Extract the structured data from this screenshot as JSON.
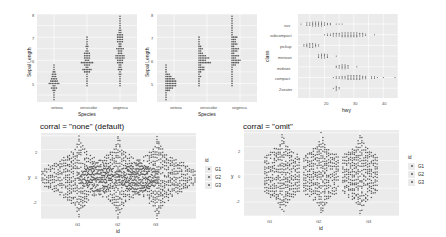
{
  "chart_data": [
    {
      "type": "scatter",
      "subtype": "dotplot",
      "title": "",
      "xlabel": "Species",
      "ylabel": "Sepal Length",
      "categories": [
        "setosa",
        "versicolor",
        "virginica"
      ],
      "yticks": [
        5,
        6,
        7,
        8
      ],
      "ylim": [
        4.2,
        8.0
      ],
      "stackdir": "center",
      "ranges": {
        "setosa": [
          4.3,
          5.8
        ],
        "versicolor": [
          4.9,
          7.0
        ],
        "virginica": [
          4.9,
          7.9
        ]
      },
      "grid": true
    },
    {
      "type": "scatter",
      "subtype": "dotplot",
      "title": "",
      "xlabel": "Species",
      "ylabel": "Sepal Length",
      "categories": [
        "setosa",
        "versicolor",
        "virginica"
      ],
      "yticks": [
        5,
        6,
        7,
        8
      ],
      "ylim": [
        4.2,
        8.0
      ],
      "stackdir": "up",
      "ranges": {
        "setosa": [
          4.3,
          5.8
        ],
        "versicolor": [
          4.9,
          7.0
        ],
        "virginica": [
          4.9,
          7.9
        ]
      },
      "grid": true
    },
    {
      "type": "scatter",
      "subtype": "dotplot",
      "title": "",
      "xlabel": "hwy",
      "ylabel": "class",
      "categories": [
        "2seater",
        "compact",
        "midsize",
        "minivan",
        "pickup",
        "subcompact",
        "suv"
      ],
      "xticks": [
        20,
        30,
        40
      ],
      "xlim": [
        11,
        45
      ],
      "ranges": {
        "suv": [
          12,
          27
        ],
        "subcompact": [
          20,
          44
        ],
        "pickup": [
          12,
          22
        ],
        "minivan": [
          17,
          24
        ],
        "midsize": [
          23,
          32
        ],
        "compact": [
          23,
          44
        ],
        "2seater": [
          23,
          26
        ]
      },
      "grid": true
    },
    {
      "type": "scatter",
      "subtype": "beeswarm",
      "title": "corral = \"none\" (default)",
      "xlabel": "id",
      "ylabel": "y",
      "categories": [
        "G1",
        "G2",
        "G3"
      ],
      "yticks": [
        -2,
        0,
        2
      ],
      "ylim": [
        -3,
        3.2
      ],
      "legend": {
        "title": "id",
        "entries": [
          "G1",
          "G2",
          "G3"
        ],
        "position": "right"
      },
      "grid": true
    },
    {
      "type": "scatter",
      "subtype": "beeswarm",
      "title": "corral = \"omit\"",
      "xlabel": "id",
      "ylabel": "y",
      "categories": [
        "G1",
        "G2",
        "G3"
      ],
      "yticks": [
        -2,
        0,
        2
      ],
      "ylim": [
        -3,
        3.2
      ],
      "legend": {
        "title": "id",
        "entries": [
          "G1",
          "G2",
          "G3"
        ],
        "position": "right"
      },
      "grid": true
    }
  ],
  "plots": {
    "p1": {
      "ylabel": "Sepal Length",
      "xlabel": "Species",
      "yt": [
        "8",
        "7",
        "6",
        "5"
      ],
      "xt": [
        "setosa",
        "versicolor",
        "virginica"
      ]
    },
    "p2": {
      "ylabel": "Sepal Length",
      "xlabel": "Species",
      "yt": [
        "8",
        "7",
        "6",
        "5"
      ],
      "xt": [
        "setosa",
        "versicolor",
        "virginica"
      ]
    },
    "p3": {
      "ylabel": "class",
      "xlabel": "hwy",
      "yt": [
        "suv",
        "subcompact",
        "pickup",
        "minivan",
        "midsize",
        "compact",
        "2seater"
      ],
      "xt": [
        "20",
        "30",
        "40"
      ]
    },
    "p4": {
      "title": "corral = \"none\" (default)",
      "ylabel": "y",
      "xlabel": "id",
      "yt": [
        "2",
        "0",
        "-2"
      ],
      "xt": [
        "G1",
        "G2",
        "G3"
      ],
      "legend_title": "id",
      "legend": [
        "G1",
        "G2",
        "G3"
      ]
    },
    "p5": {
      "title": "corral = \"omit\"",
      "ylabel": "y",
      "xlabel": "id",
      "yt": [
        "2",
        "0",
        "-2"
      ],
      "xt": [
        "G1",
        "G2",
        "G3"
      ],
      "legend_title": "id",
      "legend": [
        "G1",
        "G2",
        "G3"
      ]
    }
  },
  "colors": {
    "panel": "#ebebeb",
    "grid": "#ffffff",
    "point": "#595959"
  }
}
